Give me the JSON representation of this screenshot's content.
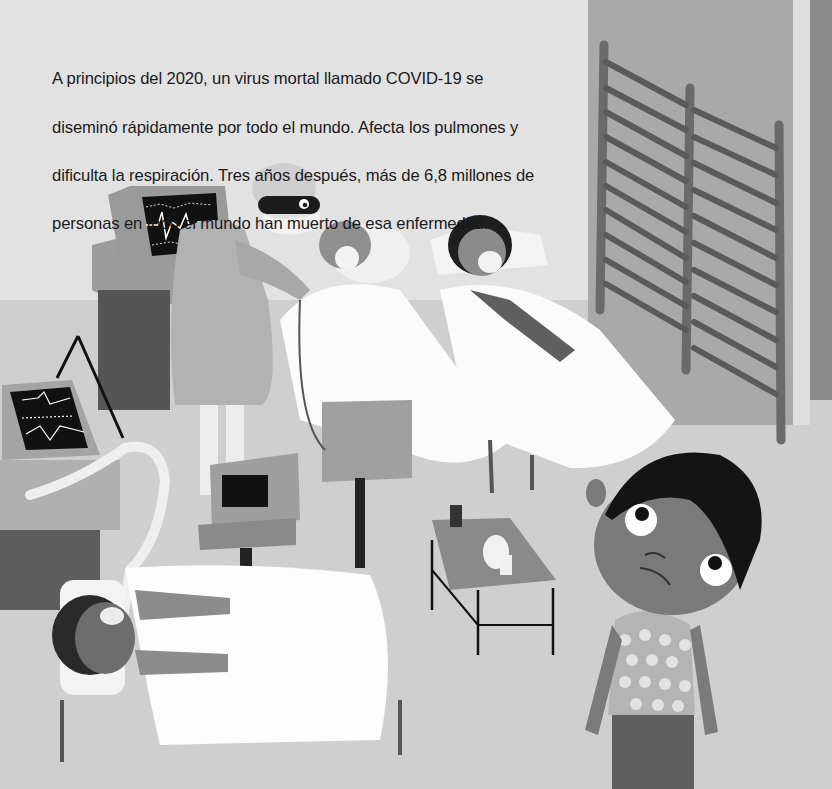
{
  "page": {
    "text_lines": [
      "A principios del 2020, un virus mortal llamado COVID-19 se",
      "diseminó rápidamente por todo el mundo. Afecta los pulmones y",
      "dificulta la respiración. Tres años después, más de 6,8 millones de",
      "personas en todo el mundo han muerto de esa enfermedad."
    ]
  },
  "illustration": {
    "scene": "hospital-ward",
    "elements": [
      "heart-monitor",
      "nurse-with-mask-and-goggles",
      "patient-elderly-with-mask",
      "patient-girl-with-mask",
      "folding-screen",
      "ventilator-machine",
      "monitor-cart",
      "patient-on-ventilator",
      "side-table-with-medicine",
      "worried-boy-with-spots"
    ],
    "colors": {
      "wall": "#e2e2e2",
      "floor": "#cfcfcf",
      "pillar": "#a9a9a9",
      "screen": "#111111",
      "sheet": "#fafafa",
      "text": "#1a1a1a"
    }
  }
}
